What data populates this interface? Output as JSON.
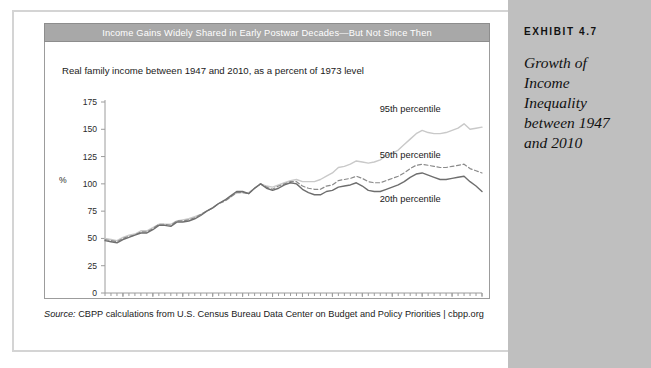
{
  "sidebar": {
    "exhibit_label": "EXHIBIT 4.7",
    "exhibit_title": "Growth of Income Inequality between 1947 and 2010"
  },
  "chart_card": {
    "header_title": "Income Gains Widely Shared in Early Postwar Decades—But Not Since Then",
    "subtitle": "Real family income between 1947 and 2010, as a percent of 1973 level"
  },
  "source": {
    "prefix": "Source:",
    "text": " CBPP calculations from U.S. Census Bureau Data Center on Budget and Policy Priorities | cbpp.org"
  },
  "colors": {
    "header_bar": "#a8a8a8",
    "sidebar": "#bfbfbf",
    "series_95th": "#c9c9c9",
    "series_50th": "#8a8a8a",
    "series_20th": "#6e6e6e",
    "axis": "#9c9c9c"
  },
  "chart_data": {
    "type": "line",
    "title": "Income Gains Widely Shared in Early Postwar Decades—But Not Since Then",
    "subtitle": "Real family income between 1947 and 2010, as a percent of 1973 level",
    "xlabel": "",
    "ylabel": "%",
    "ylim": [
      0,
      175
    ],
    "xlim": [
      1947,
      2010
    ],
    "yticks": [
      0,
      25,
      50,
      75,
      100,
      125,
      150,
      175
    ],
    "xticks": [
      1950,
      1955,
      1960,
      1965,
      1970,
      1975,
      1980,
      1985,
      1990,
      1995,
      2000,
      2005,
      2010
    ],
    "xticklabels": [
      "'50",
      "'55",
      "'60",
      "'65",
      "'70",
      "'75",
      "'80",
      "'85",
      "'90",
      "'95",
      "'00",
      "'05",
      "'10"
    ],
    "grid": false,
    "legend_position": "inline-right",
    "minor_xticks_every": 1,
    "annotations": [
      {
        "text": "95th percentile",
        "x": 1998,
        "y": 166
      },
      {
        "text": "50th percentile",
        "x": 1998,
        "y": 124
      },
      {
        "text": "20th percentile",
        "x": 1998,
        "y": 83
      }
    ],
    "x": [
      1947,
      1948,
      1949,
      1950,
      1951,
      1952,
      1953,
      1954,
      1955,
      1956,
      1957,
      1958,
      1959,
      1960,
      1961,
      1962,
      1963,
      1964,
      1965,
      1966,
      1967,
      1968,
      1969,
      1970,
      1971,
      1972,
      1973,
      1974,
      1975,
      1976,
      1977,
      1978,
      1979,
      1980,
      1981,
      1982,
      1983,
      1984,
      1985,
      1986,
      1987,
      1988,
      1989,
      1990,
      1991,
      1992,
      1993,
      1994,
      1995,
      1996,
      1997,
      1998,
      1999,
      2000,
      2001,
      2002,
      2003,
      2004,
      2005,
      2006,
      2007,
      2008,
      2009,
      2010
    ],
    "series": [
      {
        "name": "95th percentile",
        "style": "solid",
        "color": "#c9c9c9",
        "values": [
          50,
          49,
          48,
          51,
          53,
          54,
          57,
          57,
          60,
          63,
          63,
          63,
          66,
          67,
          68,
          70,
          72,
          75,
          78,
          82,
          85,
          88,
          92,
          92,
          92,
          96,
          100,
          98,
          97,
          99,
          101,
          103,
          104,
          102,
          102,
          102,
          104,
          107,
          110,
          115,
          116,
          118,
          121,
          120,
          119,
          120,
          122,
          126,
          128,
          131,
          136,
          141,
          146,
          149,
          147,
          146,
          146,
          147,
          149,
          151,
          155,
          150,
          151,
          152
        ]
      },
      {
        "name": "50th percentile",
        "style": "dashed",
        "color": "#8a8a8a",
        "values": [
          49,
          48,
          47,
          50,
          52,
          53,
          56,
          56,
          59,
          63,
          63,
          62,
          66,
          66,
          67,
          69,
          72,
          75,
          78,
          82,
          84,
          88,
          92,
          92,
          91,
          96,
          100,
          97,
          95,
          98,
          100,
          102,
          102,
          98,
          96,
          95,
          95,
          98,
          99,
          103,
          104,
          105,
          107,
          105,
          102,
          101,
          101,
          103,
          105,
          107,
          110,
          114,
          117,
          118,
          117,
          116,
          115,
          115,
          116,
          117,
          118,
          114,
          112,
          110
        ]
      },
      {
        "name": "20th percentile",
        "style": "solid",
        "color": "#6e6e6e",
        "values": [
          48,
          47,
          46,
          49,
          51,
          53,
          55,
          55,
          58,
          62,
          62,
          61,
          65,
          65,
          66,
          68,
          71,
          75,
          78,
          82,
          85,
          89,
          93,
          93,
          91,
          96,
          100,
          96,
          94,
          96,
          99,
          101,
          100,
          95,
          92,
          90,
          90,
          93,
          94,
          97,
          98,
          99,
          101,
          98,
          94,
          93,
          93,
          95,
          97,
          99,
          102,
          106,
          109,
          110,
          108,
          106,
          104,
          104,
          105,
          106,
          107,
          102,
          98,
          93
        ]
      }
    ]
  }
}
